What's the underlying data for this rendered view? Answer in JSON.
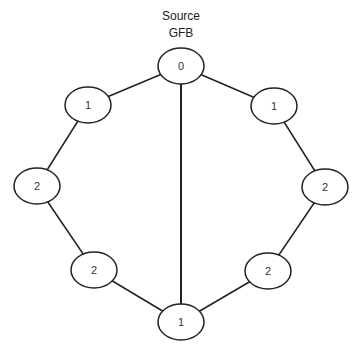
{
  "title": {
    "line1": "Source",
    "line2": "GFB"
  },
  "graph": {
    "nodes": [
      {
        "id": "n0",
        "label": "0",
        "cx": 181,
        "cy": 66
      },
      {
        "id": "l1",
        "label": "1",
        "cx": 88,
        "cy": 105
      },
      {
        "id": "l2",
        "label": "2",
        "cx": 37,
        "cy": 186
      },
      {
        "id": "l3",
        "label": "2",
        "cx": 94,
        "cy": 270
      },
      {
        "id": "b",
        "label": "1",
        "cx": 181,
        "cy": 322
      },
      {
        "id": "r3",
        "label": "2",
        "cx": 268,
        "cy": 271
      },
      {
        "id": "r2",
        "label": "2",
        "cx": 325,
        "cy": 187
      },
      {
        "id": "r1",
        "label": "1",
        "cx": 274,
        "cy": 106
      }
    ],
    "edges": [
      [
        "n0",
        "l1"
      ],
      [
        "l1",
        "l2"
      ],
      [
        "l2",
        "l3"
      ],
      [
        "l3",
        "b"
      ],
      [
        "n0",
        "r1"
      ],
      [
        "r1",
        "r2"
      ],
      [
        "r2",
        "r3"
      ],
      [
        "r3",
        "b"
      ],
      [
        "n0",
        "b"
      ]
    ],
    "stroke_color": "#222222",
    "fill_color": "#ffffff"
  }
}
